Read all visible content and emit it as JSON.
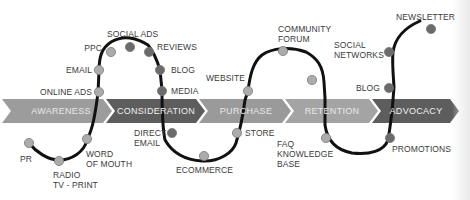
{
  "diagram": {
    "type": "customer-journey",
    "stages": [
      {
        "label": "AWARENESS",
        "color": "#9a9a9a"
      },
      {
        "label": "CONSIDERATION",
        "color": "#5e5e5e"
      },
      {
        "label": "PURCHASE",
        "color": "#9a9a9a"
      },
      {
        "label": "RETENTION",
        "color": "#a3a3a3"
      },
      {
        "label": "ADVOCACY",
        "color": "#5e5e5e"
      }
    ],
    "touchpoints": {
      "pr": "PR",
      "radio": "RADIO\nTV - PRINT",
      "word_of_mouth": "WORD\nOF MOUTH",
      "online_ads": "ONLINE ADS",
      "email": "EMAIL",
      "ppc": "PPC",
      "social_ads": "SOCIAL ADS",
      "reviews": "REVIEWS",
      "blog": "BLOG",
      "media": "MEDIA",
      "direct_email": "DIRECT\nEMAIL",
      "ecommerce": "ECOMMERCE",
      "store": "STORE",
      "website": "WEBSITE",
      "community_forum": "COMMUNITY\nFORUM",
      "faq": "FAQ\nKNOWLEDGE\nBASE",
      "promotions": "PROMOTIONS",
      "blog2": "BLOG",
      "social_networks": "SOCIAL\nNETWORKS",
      "newsletter": "NEWSLETTER"
    },
    "colors": {
      "line": "#111111",
      "dot_light": "#a8a8a8",
      "dot_dark": "#6a6a6a",
      "dot_stroke": "#777777"
    }
  }
}
